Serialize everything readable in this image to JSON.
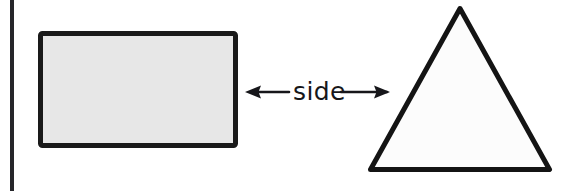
{
  "figure": {
    "background_color": "#ffffff",
    "canvas": {
      "width": 574,
      "height": 191
    }
  },
  "page_edge": {
    "name": "page-binding-line",
    "color": "#26262a",
    "x": 10,
    "width": 4,
    "height": 191
  },
  "shapes": {
    "rectangle": {
      "label": "rectangle",
      "stroke_color": "#1a1a1a",
      "fill_color": "#e7e7e7",
      "stroke_width": 5,
      "x": 38,
      "y": 31,
      "width": 200,
      "height": 117
    },
    "triangle": {
      "label": "triangle",
      "stroke_color": "#141414",
      "fill_color": "#fcfcfc",
      "stroke_width": 5,
      "apex_x": 460,
      "apex_y": 6,
      "base_left_x": 368,
      "base_right_x": 552,
      "base_y": 172
    }
  },
  "annotation": {
    "label": "side",
    "arrow_color": "#16161a",
    "arrow_y": 92,
    "left_tip_x": 245,
    "right_tip_x": 390,
    "text_x": 293,
    "text_right_x": 337,
    "text_baseline_y": 100,
    "style": "double-headed-arrow"
  }
}
